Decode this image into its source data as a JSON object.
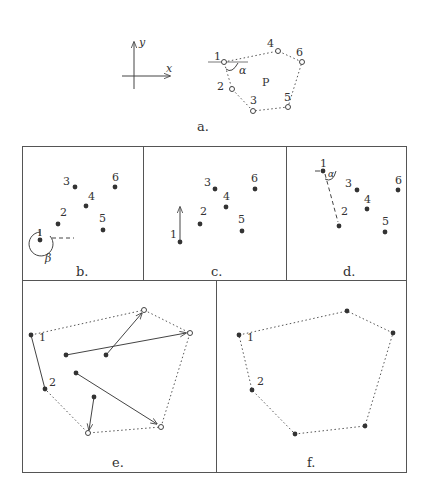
{
  "figure": {
    "panels": {
      "a": {
        "caption": "a.",
        "axis_labels": {
          "x": "x",
          "y": "y"
        },
        "polygon_label": "P",
        "angle_label": "α",
        "points": [
          {
            "id": "1",
            "label": "1",
            "x": 224,
            "y": 62
          },
          {
            "id": "2",
            "label": "2",
            "x": 232,
            "y": 89
          },
          {
            "id": "3",
            "label": "3",
            "x": 253,
            "y": 111
          },
          {
            "id": "4",
            "label": "4",
            "x": 278,
            "y": 51
          },
          {
            "id": "5",
            "label": "5",
            "x": 288,
            "y": 107
          },
          {
            "id": "6",
            "label": "6",
            "x": 302,
            "y": 62
          }
        ]
      },
      "b": {
        "caption": "b.",
        "angle_label": "β",
        "points": [
          {
            "label": "1",
            "x": 40,
            "y": 240
          },
          {
            "label": "2",
            "x": 58,
            "y": 224
          },
          {
            "label": "3",
            "x": 75,
            "y": 187
          },
          {
            "label": "4",
            "x": 86,
            "y": 206
          },
          {
            "label": "5",
            "x": 103,
            "y": 230
          },
          {
            "label": "6",
            "x": 115,
            "y": 187
          }
        ]
      },
      "c": {
        "caption": "c.",
        "points": [
          {
            "label": "1",
            "x": 180,
            "y": 242
          },
          {
            "label": "2",
            "x": 200,
            "y": 224
          },
          {
            "label": "3",
            "x": 215,
            "y": 189
          },
          {
            "label": "4",
            "x": 226,
            "y": 207
          },
          {
            "label": "5",
            "x": 242,
            "y": 231
          },
          {
            "label": "6",
            "x": 255,
            "y": 189
          }
        ]
      },
      "d": {
        "caption": "d.",
        "angle_label": "α",
        "points": [
          {
            "label": "1",
            "x": 323,
            "y": 171
          },
          {
            "label": "2",
            "x": 339,
            "y": 226
          },
          {
            "label": "3",
            "x": 357,
            "y": 190
          },
          {
            "label": "4",
            "x": 367,
            "y": 209
          },
          {
            "label": "5",
            "x": 385,
            "y": 232
          },
          {
            "label": "6",
            "x": 398,
            "y": 190
          }
        ]
      },
      "e": {
        "caption": "e.",
        "labels": [
          "1",
          "2"
        ]
      },
      "f": {
        "caption": "f.",
        "labels": [
          "1",
          "2"
        ]
      }
    }
  }
}
